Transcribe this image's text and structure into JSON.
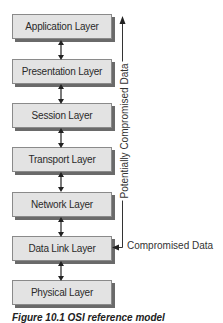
{
  "diagram": {
    "layers": [
      {
        "label": "Application Layer"
      },
      {
        "label": "Presentation Layer"
      },
      {
        "label": "Session Layer"
      },
      {
        "label": "Transport Layer"
      },
      {
        "label": "Network Layer"
      },
      {
        "label": "Data Link Layer"
      },
      {
        "label": "Physical Layer"
      }
    ],
    "annotations": {
      "potentially_compromised": "Potentially Compromised Data",
      "compromised": "Compromised Data"
    },
    "caption": "Figure 10.1  OSI reference model"
  }
}
